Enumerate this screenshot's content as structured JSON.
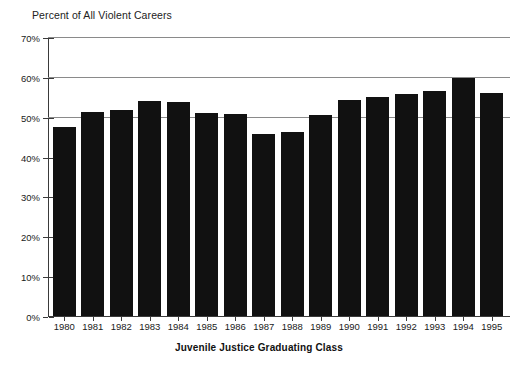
{
  "chart_data": {
    "type": "bar",
    "title": "Percent of All Violent Careers",
    "xlabel": "Juvenile Justice Graduating Class",
    "ylabel": "",
    "categories": [
      "1980",
      "1981",
      "1982",
      "1983",
      "1984",
      "1985",
      "1986",
      "1987",
      "1988",
      "1989",
      "1990",
      "1991",
      "1992",
      "1993",
      "1994",
      "1995"
    ],
    "values": [
      47.4,
      51.1,
      51.6,
      53.9,
      53.7,
      50.9,
      50.6,
      45.6,
      46.1,
      50.5,
      54.3,
      54.9,
      55.7,
      56.4,
      59.6,
      56.0
    ],
    "value_suffix": "%",
    "ylim": [
      0,
      70
    ],
    "ytick_values": [
      0,
      10,
      20,
      30,
      40,
      50,
      60,
      70
    ],
    "ytick_labels": [
      "0%",
      "10%",
      "20%",
      "30%",
      "40%",
      "50%",
      "60%",
      "70%"
    ],
    "gridlines_at": [
      50,
      60,
      70
    ],
    "grid": true,
    "legend": "none",
    "bar_color": "#111111",
    "grid_color": "#8a8a8a",
    "axis_color": "#3a3a3a"
  }
}
